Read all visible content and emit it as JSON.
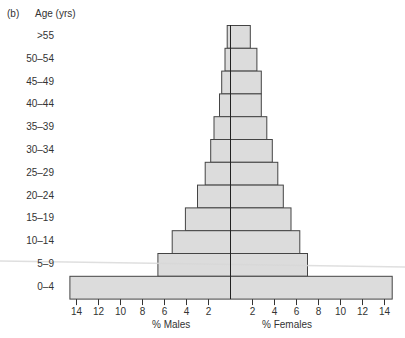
{
  "chart_data": {
    "type": "bar",
    "orientation": "horizontal",
    "subtype": "population-pyramid",
    "panel_label": "(b)",
    "title": "",
    "ylabel": "Age (yrs)",
    "categories": [
      ">55",
      "50–54",
      "45–49",
      "40–44",
      "35–39",
      "30–34",
      "25–29",
      "20–24",
      "15–19",
      "10–14",
      "5–9",
      "0–4"
    ],
    "series": [
      {
        "name": "% Males",
        "side": "left",
        "values": [
          0.3,
          0.5,
          0.8,
          1.0,
          1.5,
          1.8,
          2.3,
          3.0,
          4.1,
          5.3,
          6.6,
          14.6
        ]
      },
      {
        "name": "% Females",
        "side": "right",
        "values": [
          1.8,
          2.4,
          2.8,
          2.8,
          3.3,
          3.8,
          4.3,
          4.8,
          5.5,
          6.3,
          7.0,
          14.7
        ]
      }
    ],
    "x_ticks_left": [
      "14",
      "12",
      "10",
      "8",
      "6",
      "4",
      "2"
    ],
    "x_ticks_right": [
      "2",
      "4",
      "6",
      "8",
      "10",
      "12",
      "14"
    ],
    "x_tick_values": [
      14,
      12,
      10,
      8,
      6,
      4,
      2
    ],
    "xlabel_left": "% Males",
    "xlabel_right": "% Females",
    "xlim": [
      0,
      15
    ],
    "grid": false,
    "legend": "none",
    "colors": {
      "bar_fill": "#dcdcdc",
      "bar_stroke": "#444444",
      "axis": "#222222"
    }
  }
}
